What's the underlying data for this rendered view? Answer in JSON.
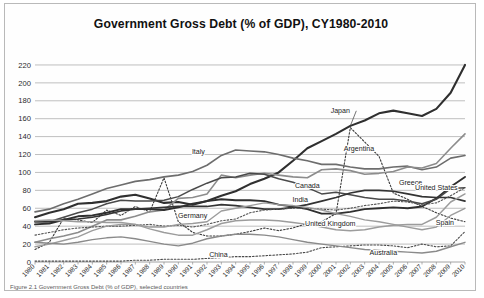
{
  "card": {
    "caption_partial": "Figure 2.1 Government Gross Debt (% of GDP), selected countries"
  },
  "chart_data": {
    "type": "line",
    "title": "Government Gross Debt (% of GDP), CY1980-2010",
    "xlabel": "",
    "ylabel": "",
    "ylim": [
      0,
      230
    ],
    "yticks": [
      0,
      20,
      40,
      60,
      80,
      100,
      120,
      140,
      160,
      180,
      200,
      220
    ],
    "grid": true,
    "legend": "inline-labels",
    "x": [
      1980,
      1981,
      1982,
      1983,
      1984,
      1985,
      1986,
      1987,
      1988,
      1989,
      1990,
      1991,
      1992,
      1993,
      1994,
      1995,
      1996,
      1997,
      1998,
      1999,
      2000,
      2001,
      2002,
      2003,
      2004,
      2005,
      2006,
      2007,
      2008,
      2009,
      2010
    ],
    "xticklabels": [
      "1980",
      "1981",
      "1982",
      "1983",
      "1984",
      "1985",
      "1986",
      "1987",
      "1988",
      "1989",
      "1990",
      "1991",
      "1992",
      "1993",
      "1994",
      "1995",
      "1996",
      "1997",
      "1998",
      "1999",
      "2000",
      "2001",
      "2002",
      "2003",
      "2004",
      "2005",
      "2006",
      "2007",
      "2008",
      "2009",
      "2010"
    ],
    "series": [
      {
        "name": "Japan",
        "label": "Japan",
        "color": "#2f2f2f",
        "width": 2.1,
        "dash": "none",
        "label_x": 2001.3,
        "label_y": 166,
        "leader": true,
        "values": [
          50,
          55,
          59,
          65,
          66,
          68,
          73,
          75,
          71,
          66,
          67,
          64,
          68,
          74,
          79,
          87,
          93,
          100,
          113,
          127,
          135,
          143,
          152,
          158,
          166,
          169,
          166,
          163,
          171,
          189,
          220
        ]
      },
      {
        "name": "Argentina",
        "label": "Argentina",
        "color": "#3a3a3a",
        "width": 1.1,
        "dash": "1.6,1.8",
        "label_x": 2002.6,
        "label_y": 124,
        "leader": false,
        "values": [
          14,
          22,
          49,
          47,
          44,
          58,
          52,
          62,
          56,
          94,
          45,
          33,
          29,
          29,
          31,
          34,
          38,
          35,
          38,
          43,
          45,
          54,
          150,
          134,
          118,
          77,
          70,
          62,
          55,
          49,
          45
        ]
      },
      {
        "name": "Italy",
        "label": "Italy",
        "color": "#6d6d6d",
        "width": 1.6,
        "dash": "none",
        "label_x": 1991.4,
        "label_y": 121,
        "leader": false,
        "values": [
          56,
          59,
          65,
          70,
          76,
          82,
          86,
          90,
          92,
          95,
          97,
          101,
          108,
          119,
          125,
          124,
          123,
          120,
          116,
          113,
          109,
          109,
          106,
          104,
          104,
          106,
          107,
          103,
          106,
          116,
          119
        ]
      },
      {
        "name": "Greece",
        "label": "Greece",
        "color": "#8c8c8c",
        "width": 1.6,
        "dash": "none",
        "label_x": 2006.2,
        "label_y": 86,
        "leader": false,
        "values": [
          22,
          26,
          29,
          33,
          40,
          47,
          47,
          51,
          56,
          58,
          71,
          72,
          76,
          97,
          94,
          97,
          99,
          97,
          95,
          94,
          103,
          104,
          102,
          98,
          99,
          101,
          106,
          105,
          110,
          127,
          143
        ]
      },
      {
        "name": "United States",
        "label": "United States",
        "color": "#2f2f2f",
        "width": 1.9,
        "dash": "none",
        "label_x": 2008.0,
        "label_y": 80,
        "leader": false,
        "values": [
          42,
          43,
          47,
          51,
          52,
          55,
          59,
          59,
          59,
          58,
          61,
          65,
          68,
          70,
          69,
          69,
          68,
          64,
          62,
          59,
          54,
          54,
          56,
          59,
          60,
          61,
          60,
          62,
          71,
          84,
          95
        ]
      },
      {
        "name": "Canada",
        "label": "Canada",
        "color": "#4a4a4a",
        "width": 1.5,
        "dash": "none",
        "label_x": 1999.0,
        "label_y": 83,
        "leader": false,
        "values": [
          45,
          45,
          50,
          55,
          59,
          65,
          69,
          68,
          68,
          69,
          73,
          81,
          88,
          94,
          95,
          99,
          98,
          93,
          89,
          83,
          76,
          78,
          75,
          72,
          70,
          70,
          68,
          65,
          70,
          82,
          83
        ]
      },
      {
        "name": "India",
        "label": "India",
        "color": "#333333",
        "width": 1.7,
        "dash": "none",
        "label_x": 1998.5,
        "label_y": 67,
        "leader": false,
        "values": [
          45,
          45,
          47,
          48,
          50,
          53,
          57,
          59,
          60,
          61,
          62,
          62,
          62,
          64,
          63,
          61,
          59,
          59,
          61,
          64,
          68,
          72,
          77,
          80,
          80,
          79,
          76,
          73,
          72,
          72,
          68
        ]
      },
      {
        "name": "Germany",
        "label": "Germany",
        "color": "#555555",
        "width": 1.1,
        "dash": "1.6,1.8",
        "label_x": 1991.0,
        "label_y": 49,
        "leader": false,
        "values": [
          30,
          33,
          36,
          38,
          39,
          40,
          40,
          41,
          42,
          40,
          41,
          39,
          42,
          46,
          48,
          55,
          58,
          59,
          60,
          60,
          59,
          58,
          60,
          63,
          65,
          68,
          67,
          64,
          66,
          74,
          83
        ]
      },
      {
        "name": "United Kingdom",
        "label": "United Kingdom",
        "color": "#9c9c9c",
        "width": 1.5,
        "dash": "none",
        "label_x": 2000.6,
        "label_y": 40,
        "leader": false,
        "values": [
          46,
          47,
          46,
          45,
          45,
          44,
          44,
          42,
          37,
          33,
          30,
          30,
          36,
          43,
          46,
          47,
          47,
          46,
          44,
          42,
          39,
          36,
          35,
          36,
          39,
          41,
          42,
          42,
          50,
          67,
          76
        ]
      },
      {
        "name": "Spain",
        "label": "Spain",
        "color": "#9c9c9c",
        "width": 1.4,
        "dash": "none",
        "label_x": 2008.6,
        "label_y": 41,
        "leader": false,
        "values": [
          17,
          20,
          24,
          28,
          35,
          40,
          42,
          42,
          39,
          39,
          42,
          43,
          45,
          57,
          60,
          63,
          66,
          64,
          63,
          61,
          58,
          54,
          51,
          47,
          45,
          42,
          39,
          36,
          39,
          52,
          60
        ]
      },
      {
        "name": "China",
        "label": "China",
        "color": "#4a4a4a",
        "width": 1.1,
        "dash": "1.6,1.8",
        "label_x": 1992.8,
        "label_y": 6,
        "leader": false,
        "values": [
          1,
          1,
          1,
          1,
          1,
          1,
          1,
          2,
          2,
          3,
          3,
          3,
          4,
          5,
          6,
          6,
          7,
          8,
          9,
          11,
          16,
          17,
          18,
          19,
          19,
          18,
          16,
          20,
          17,
          18,
          34
        ]
      },
      {
        "name": "Australia",
        "label": "Australia",
        "color": "#8a8a8a",
        "width": 1.4,
        "dash": "none",
        "label_x": 2004.3,
        "label_y": 8,
        "leader": false,
        "values": [
          22,
          21,
          20,
          22,
          25,
          27,
          28,
          26,
          23,
          20,
          18,
          21,
          26,
          29,
          31,
          31,
          30,
          28,
          25,
          22,
          20,
          18,
          16,
          14,
          13,
          12,
          11,
          10,
          12,
          17,
          22
        ]
      }
    ]
  }
}
